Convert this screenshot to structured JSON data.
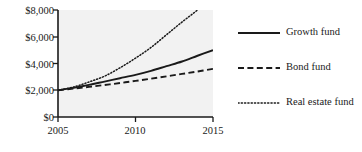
{
  "chart_data": {
    "type": "line",
    "title": "",
    "xlabel": "",
    "ylabel": "",
    "xlim": [
      2005,
      2015
    ],
    "ylim": [
      0,
      8000
    ],
    "grid": false,
    "legend_position": "right",
    "x_ticks": [
      "2005",
      "2010",
      "2015"
    ],
    "x_tick_values": [
      2005,
      2010,
      2015
    ],
    "y_ticks": [
      "$0",
      "$2,000",
      "$4,000",
      "$6,000",
      "$8,000"
    ],
    "y_tick_values": [
      0,
      2000,
      4000,
      6000,
      8000
    ],
    "x": [
      2005,
      2006,
      2007,
      2008,
      2009,
      2010,
      2011,
      2012,
      2013,
      2014,
      2015
    ],
    "series": [
      {
        "name": "Growth fund",
        "style": "solid",
        "color": "#1a1a1a",
        "values": [
          2000,
          2180,
          2400,
          2650,
          2900,
          3150,
          3450,
          3800,
          4150,
          4580,
          5000
        ]
      },
      {
        "name": "Bond fund",
        "style": "dashed",
        "color": "#1a1a1a",
        "values": [
          2000,
          2120,
          2250,
          2390,
          2540,
          2700,
          2870,
          3040,
          3220,
          3400,
          3600
        ]
      },
      {
        "name": "Real estate fund",
        "style": "dotted",
        "color": "#1a1a1a",
        "values": [
          2000,
          2240,
          2620,
          3050,
          3680,
          4400,
          5200,
          6150,
          7100,
          8000,
          9000
        ]
      }
    ]
  },
  "axes": {
    "y_tick_labels": [
      {
        "text": "$8,000"
      },
      {
        "text": "$6,000"
      },
      {
        "text": "$4,000"
      },
      {
        "text": "$2,000"
      },
      {
        "text": "$0"
      }
    ],
    "x_tick_labels": [
      {
        "text": "2005"
      },
      {
        "text": "2010"
      },
      {
        "text": "2015"
      }
    ]
  },
  "legend": {
    "entries": [
      {
        "label": "Growth fund",
        "style": "solid"
      },
      {
        "label": "Bond fund",
        "style": "dashed"
      },
      {
        "label": "Real estate fund",
        "style": "dotted"
      }
    ]
  },
  "colors": {
    "plot_background": "#f2f2f2",
    "figure_background": "#ffffff",
    "axis": "#1a1a1a",
    "line": "#1a1a1a"
  }
}
